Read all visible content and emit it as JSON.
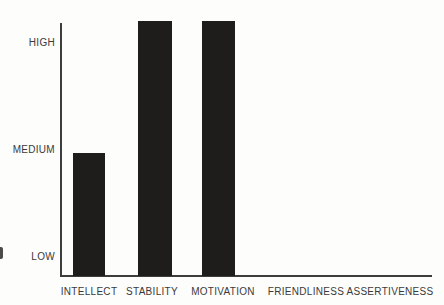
{
  "chart_data": {
    "type": "bar",
    "title": "",
    "categories": [
      "INTELLECT",
      "STABILITY",
      "MOTIVATION",
      "FRIENDLINESS",
      "ASSERTIVENESS"
    ],
    "values": [
      1.97,
      3.21,
      3.21,
      0,
      0
    ],
    "value_labels": [
      "MEDIUM",
      "HIGH",
      "HIGH",
      "NONE",
      "NONE"
    ],
    "y_ticks": [
      "LOW",
      "MEDIUM",
      "HIGH"
    ],
    "y_tick_values": [
      1,
      2,
      3
    ],
    "value_scale": {
      "LOW": 1,
      "MEDIUM": 2,
      "HIGH": 3
    },
    "ylim": [
      0.82,
      3.35
    ],
    "xlabel": "",
    "ylabel": "",
    "grid": false,
    "legend": false,
    "bar_color": "#1f1d1b",
    "axis_color": "#3d3d3d",
    "text_color": "#3a3a3a",
    "background_color": "#fdfdfc",
    "layout": {
      "baseline_y_px": 276,
      "tick_y_px": [
        257,
        150,
        43
      ],
      "tick_spacing_px": 107,
      "bar_left_px": [
        73,
        138,
        202
      ],
      "bar_width_px": [
        32,
        34,
        33
      ],
      "xlabel_center_px": [
        89,
        152,
        223,
        306,
        390
      ],
      "xlabel_y_px": 292
    }
  }
}
